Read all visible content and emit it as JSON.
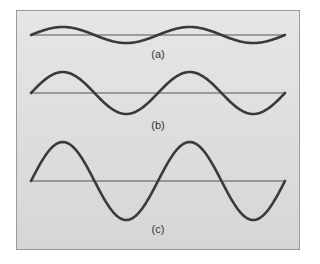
{
  "figure": {
    "panels": [
      {
        "id": "a",
        "label": "(a)",
        "amplitude": 8,
        "baseline_y": 35,
        "label_y": 48,
        "cycles": 2
      },
      {
        "id": "b",
        "label": "(b)",
        "amplitude": 21,
        "baseline_y": 93,
        "label_y": 120,
        "cycles": 2
      },
      {
        "id": "c",
        "label": "(c)",
        "amplitude": 39,
        "baseline_y": 181,
        "label_y": 224,
        "cycles": 2
      }
    ],
    "x_start": 31,
    "x_end": 285,
    "colors": {
      "wave": "#3a3a3a",
      "baseline": "#555555",
      "panel_bg": "#dedede",
      "border": "#9a9a9a"
    }
  }
}
